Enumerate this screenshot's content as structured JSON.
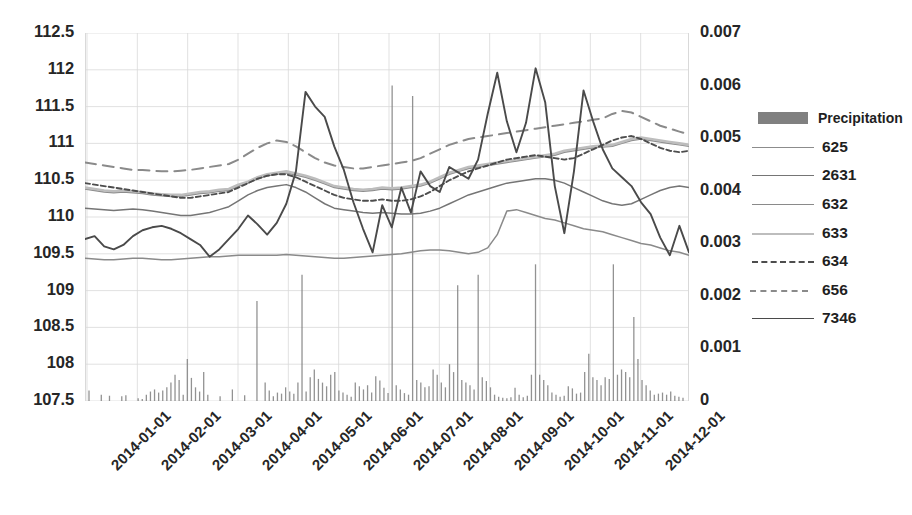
{
  "chart_data": {
    "type": "line",
    "title": "",
    "xlabel": "",
    "ylabel": "",
    "y2label": "",
    "grid": true,
    "legend_position": "right",
    "x_tick_labels": [
      "2014-01-01",
      "2014-02-01",
      "2014-03-01",
      "2014-04-01",
      "2014-05-01",
      "2014-06-01",
      "2014-07-01",
      "2014-08-01",
      "2014-09-01",
      "2014-10-01",
      "2014-11-01",
      "2014-12-01"
    ],
    "y_left_ticks": [
      "107.5",
      "108",
      "108.5",
      "109",
      "109.5",
      "110",
      "110.5",
      "111",
      "111.5",
      "112",
      "112.5"
    ],
    "y_right_ticks": [
      "0",
      "0.001",
      "0.002",
      "0.003",
      "0.004",
      "0.005",
      "0.006",
      "0.007"
    ],
    "ylim": [
      107.5,
      112.5
    ],
    "y2lim": [
      0,
      0.007
    ],
    "colors": {
      "precipitation": "#808080",
      "s625": "#8c8c8c",
      "s2631": "#757575",
      "s632": "#8a8a8a",
      "s633": "#bdbdbd",
      "s634": "#4d4d4d",
      "s656": "#8a8a8a",
      "s7346": "#4a4a4a",
      "gridline": "#d9d9d9",
      "text": "#262626"
    },
    "series": [
      {
        "name": "Precipitation",
        "axis": "right",
        "type": "bar",
        "values": [
          0.0002,
          0,
          0,
          0.00012,
          0,
          0.0001,
          0,
          0,
          9e-05,
          0.00011,
          0,
          0,
          5e-05,
          4e-05,
          0.00012,
          0.00018,
          0.00022,
          0.00016,
          0.0002,
          0.00026,
          0.00035,
          0.0005,
          0.0004,
          0.00012,
          0.0008,
          0.00044,
          0.00026,
          0.00018,
          0.00055,
          0.00012,
          0,
          0,
          9e-05,
          0,
          0,
          0.00022,
          0,
          0,
          0.00011,
          0,
          0,
          0.0019,
          0,
          0.00035,
          0.0002,
          9e-05,
          0.00016,
          0.00014,
          0.00026,
          0.00018,
          0.00014,
          0.00035,
          0.0024,
          0.00018,
          0.00045,
          0.0006,
          0.00042,
          0.00035,
          0.00028,
          0.0005,
          0.00055,
          0.0002,
          0.00016,
          0.00012,
          8e-05,
          0.00035,
          0.00028,
          0.00022,
          0.0003,
          0.00016,
          0.00047,
          0.00039,
          0.00025,
          0.00015,
          0.006,
          0.0003,
          0.00022,
          0.00015,
          0.00012,
          0.0058,
          0.0004,
          0.00035,
          0.00026,
          0.00028,
          0.0006,
          0.0005,
          0.00035,
          0.00026,
          0.0007,
          0.00055,
          0.0022,
          0.0004,
          0.00035,
          0.0003,
          0.00022,
          0.0024,
          0.00045,
          0.00038,
          0.00026,
          0.00012,
          8e-05,
          6e-05,
          5e-05,
          7e-05,
          0.00025,
          0.00012,
          7e-05,
          0.0001,
          0.0005,
          0.0026,
          0.0005,
          0.0004,
          0.0003,
          0.00016,
          0.00012,
          8e-05,
          0.0001,
          0.00028,
          0.00024,
          0.00014,
          0.00016,
          0.00055,
          0.0009,
          0.00045,
          0.0004,
          0.0003,
          0.00045,
          0.00042,
          0.0026,
          0.0005,
          0.0006,
          0.00055,
          0.00045,
          0.0016,
          0.0008,
          0.0004,
          0.0003,
          0.0002,
          0.00012,
          0.00014,
          0.00016,
          0.00012,
          0.00018,
          0.0001,
          8e-05,
          6e-05
        ]
      },
      {
        "name": "625",
        "axis": "left",
        "type": "line",
        "style": "solid",
        "values": [
          110.38,
          110.36,
          110.34,
          110.33,
          110.34,
          110.33,
          110.32,
          110.3,
          110.29,
          110.28,
          110.28,
          110.3,
          110.32,
          110.33,
          110.35,
          110.36,
          110.42,
          110.46,
          110.52,
          110.56,
          110.58,
          110.6,
          110.57,
          110.54,
          110.5,
          110.45,
          110.4,
          110.38,
          110.36,
          110.35,
          110.36,
          110.38,
          110.37,
          110.38,
          110.4,
          110.42,
          110.46,
          110.52,
          110.58,
          110.62,
          110.66,
          110.68,
          110.7,
          110.72,
          110.74,
          110.76,
          110.78,
          110.8,
          110.82,
          110.84,
          110.88,
          110.9,
          110.92,
          110.94,
          110.95,
          110.96,
          111.0,
          111.04,
          111.06,
          111.04,
          111.02,
          111.0,
          110.98,
          110.96
        ]
      },
      {
        "name": "2631",
        "axis": "left",
        "type": "line",
        "style": "solid",
        "values": [
          110.12,
          110.11,
          110.1,
          110.09,
          110.1,
          110.11,
          110.1,
          110.08,
          110.06,
          110.04,
          110.02,
          110.02,
          110.04,
          110.06,
          110.1,
          110.14,
          110.22,
          110.3,
          110.36,
          110.4,
          110.42,
          110.44,
          110.4,
          110.34,
          110.26,
          110.18,
          110.12,
          110.1,
          110.08,
          110.06,
          110.05,
          110.06,
          110.05,
          110.04,
          110.04,
          110.05,
          110.08,
          110.12,
          110.18,
          110.24,
          110.3,
          110.34,
          110.38,
          110.42,
          110.46,
          110.48,
          110.5,
          110.52,
          110.52,
          110.5,
          110.46,
          110.4,
          110.34,
          110.28,
          110.22,
          110.18,
          110.16,
          110.18,
          110.24,
          110.3,
          110.36,
          110.4,
          110.42,
          110.4
        ]
      },
      {
        "name": "632",
        "axis": "left",
        "type": "line",
        "style": "solid",
        "values": [
          109.44,
          109.43,
          109.42,
          109.42,
          109.43,
          109.44,
          109.44,
          109.43,
          109.42,
          109.42,
          109.43,
          109.44,
          109.45,
          109.46,
          109.46,
          109.47,
          109.48,
          109.48,
          109.48,
          109.48,
          109.48,
          109.49,
          109.48,
          109.47,
          109.46,
          109.45,
          109.44,
          109.44,
          109.45,
          109.46,
          109.47,
          109.48,
          109.49,
          109.5,
          109.52,
          109.54,
          109.55,
          109.55,
          109.54,
          109.52,
          109.5,
          109.52,
          109.58,
          109.76,
          110.08,
          110.1,
          110.06,
          110.02,
          109.98,
          109.96,
          109.92,
          109.88,
          109.84,
          109.82,
          109.8,
          109.76,
          109.72,
          109.68,
          109.64,
          109.62,
          109.58,
          109.54,
          109.52,
          109.48
        ]
      },
      {
        "name": "633",
        "axis": "left",
        "type": "line",
        "style": "solid",
        "values": [
          110.4,
          110.38,
          110.36,
          110.35,
          110.36,
          110.35,
          110.34,
          110.32,
          110.31,
          110.3,
          110.3,
          110.32,
          110.34,
          110.35,
          110.37,
          110.38,
          110.44,
          110.48,
          110.54,
          110.58,
          110.6,
          110.62,
          110.59,
          110.56,
          110.52,
          110.47,
          110.42,
          110.4,
          110.38,
          110.37,
          110.38,
          110.4,
          110.39,
          110.4,
          110.42,
          110.44,
          110.48,
          110.54,
          110.6,
          110.64,
          110.68,
          110.7,
          110.72,
          110.74,
          110.76,
          110.78,
          110.8,
          110.82,
          110.84,
          110.86,
          110.9,
          110.92,
          110.94,
          110.96,
          110.97,
          110.98,
          111.02,
          111.06,
          111.08,
          111.06,
          111.04,
          111.02,
          111.0,
          110.98
        ]
      },
      {
        "name": "634",
        "axis": "left",
        "type": "line",
        "style": "dotted",
        "values": [
          110.46,
          110.44,
          110.42,
          110.4,
          110.38,
          110.36,
          110.34,
          110.32,
          110.3,
          110.28,
          110.26,
          110.26,
          110.28,
          110.3,
          110.32,
          110.34,
          110.4,
          110.46,
          110.52,
          110.56,
          110.58,
          110.58,
          110.54,
          110.48,
          110.42,
          110.36,
          110.3,
          110.26,
          110.24,
          110.22,
          110.22,
          110.24,
          110.22,
          110.22,
          110.24,
          110.28,
          110.34,
          110.42,
          110.5,
          110.56,
          110.62,
          110.66,
          110.7,
          110.74,
          110.78,
          110.8,
          110.82,
          110.84,
          110.82,
          110.8,
          110.78,
          110.8,
          110.86,
          110.92,
          110.98,
          111.04,
          111.08,
          111.1,
          111.06,
          111.0,
          110.94,
          110.9,
          110.88,
          110.9
        ]
      },
      {
        "name": "656",
        "axis": "left",
        "type": "line",
        "style": "dashed",
        "values": [
          110.74,
          110.72,
          110.7,
          110.68,
          110.66,
          110.64,
          110.64,
          110.63,
          110.62,
          110.62,
          110.63,
          110.64,
          110.66,
          110.68,
          110.7,
          110.72,
          110.78,
          110.86,
          110.94,
          111.0,
          111.04,
          111.02,
          110.96,
          110.88,
          110.8,
          110.74,
          110.7,
          110.68,
          110.66,
          110.66,
          110.68,
          110.7,
          110.72,
          110.74,
          110.76,
          110.8,
          110.86,
          110.92,
          110.98,
          111.02,
          111.06,
          111.08,
          111.1,
          111.12,
          111.14,
          111.16,
          111.18,
          111.2,
          111.22,
          111.24,
          111.26,
          111.28,
          111.3,
          111.32,
          111.34,
          111.4,
          111.44,
          111.42,
          111.36,
          111.3,
          111.24,
          111.2,
          111.16,
          111.12
        ]
      },
      {
        "name": "7346",
        "axis": "left",
        "type": "line",
        "style": "solid",
        "values": [
          109.7,
          109.74,
          109.6,
          109.56,
          109.62,
          109.74,
          109.82,
          109.86,
          109.88,
          109.84,
          109.78,
          109.7,
          109.62,
          109.46,
          109.56,
          109.7,
          109.84,
          110.02,
          109.9,
          109.76,
          109.92,
          110.18,
          110.62,
          111.7,
          111.5,
          111.36,
          110.96,
          110.64,
          110.2,
          109.84,
          109.52,
          110.16,
          109.86,
          110.4,
          110.06,
          110.62,
          110.42,
          110.34,
          110.68,
          110.6,
          110.52,
          110.78,
          111.4,
          111.96,
          111.3,
          110.88,
          111.28,
          112.02,
          111.56,
          110.42,
          109.78,
          110.62,
          111.72,
          111.3,
          110.92,
          110.66,
          110.54,
          110.42,
          110.2,
          110.04,
          109.72,
          109.48,
          109.88,
          109.52
        ]
      }
    ]
  },
  "legend": {
    "items": [
      {
        "label": "Precipitation",
        "mark": "bar-swatch"
      },
      {
        "label": "625",
        "mark": "solid-line"
      },
      {
        "label": "2631",
        "mark": "solid-line"
      },
      {
        "label": "632",
        "mark": "solid-line"
      },
      {
        "label": "633",
        "mark": "solid-line"
      },
      {
        "label": "634",
        "mark": "dotted-line"
      },
      {
        "label": "656",
        "mark": "dashed-line"
      },
      {
        "label": "7346",
        "mark": "solid-line"
      }
    ]
  }
}
